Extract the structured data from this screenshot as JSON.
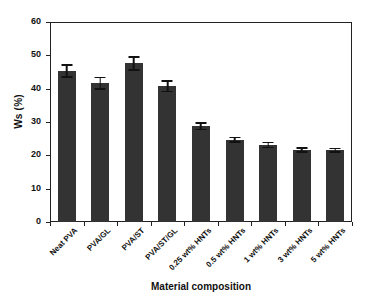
{
  "chart_data": {
    "type": "bar",
    "title": "",
    "xlabel": "Material composition",
    "ylabel": "Ws (%)",
    "categories": [
      "Neat PVA",
      "PVA/GL",
      "PVA/ST",
      "PVA/ST/GL",
      "0.25 wt% HNTs",
      "0.5 wt% HNTs",
      "1 wt% HNTs",
      "3 wt% HNTs",
      "5 wt% HNTs"
    ],
    "values": [
      45.3,
      41.6,
      47.6,
      40.7,
      28.7,
      24.7,
      23.1,
      21.6,
      21.5
    ],
    "errors": [
      2.1,
      2.0,
      2.2,
      1.8,
      1.2,
      0.9,
      1.0,
      0.8,
      0.8
    ],
    "ylim": [
      0,
      60
    ],
    "yticks": [
      0,
      10,
      20,
      30,
      40,
      50,
      60
    ],
    "ytick_labels": [
      "0",
      "10",
      "20",
      "30",
      "40",
      "50",
      "60"
    ],
    "grid": false,
    "legend": null,
    "bar_color": "#333333",
    "error_color": "#111111",
    "axis_color": "#222222",
    "background": "#ffffff"
  }
}
